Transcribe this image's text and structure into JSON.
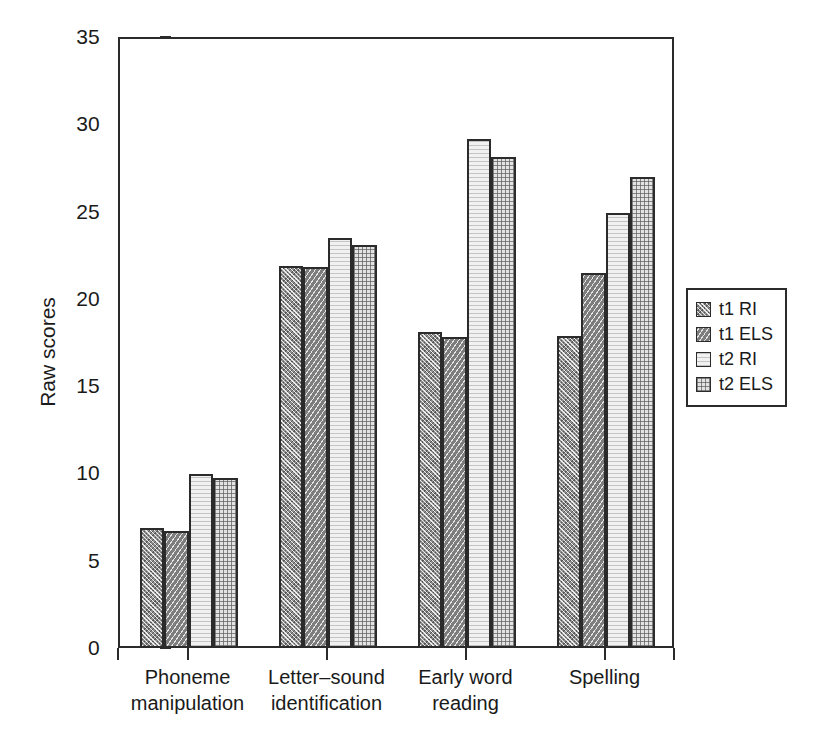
{
  "chart_data": {
    "type": "bar",
    "title": "",
    "xlabel": "",
    "ylabel": "Raw scores",
    "ylim": [
      0,
      35
    ],
    "yticks": [
      0,
      5,
      10,
      15,
      20,
      25,
      30,
      35
    ],
    "ytick_labels": [
      "0",
      "5",
      "10",
      "15",
      "20",
      "25",
      "30",
      "35"
    ],
    "grid": false,
    "legend_position": "right-outside",
    "categories": [
      "Phoneme manipulation",
      "Letter–sound identification",
      "Early word reading",
      "Spelling"
    ],
    "category_lines": [
      [
        "Phoneme",
        "manipulation"
      ],
      [
        "Letter–sound",
        "identification"
      ],
      [
        "Early word",
        "reading"
      ],
      [
        "Spelling"
      ]
    ],
    "series": [
      {
        "name": "t1 RI",
        "key": "t1ri",
        "pattern": "dark-crosshatch",
        "color": "#8e8e8e",
        "values": [
          6.9,
          21.9,
          18.1,
          17.9
        ]
      },
      {
        "name": "t1 ELS",
        "key": "t1els",
        "pattern": "dark-diagonal-hatch",
        "color": "#7d7d7d",
        "values": [
          6.7,
          21.8,
          17.8,
          21.5
        ]
      },
      {
        "name": "t2 RI",
        "key": "t2ri",
        "pattern": "light-fine-horizontal",
        "color": "#f1f1f1",
        "values": [
          9.95,
          23.5,
          29.15,
          24.9
        ]
      },
      {
        "name": "t2 ELS",
        "key": "t2els",
        "pattern": "light-grid",
        "color": "#e3e3e3",
        "values": [
          9.75,
          23.1,
          28.15,
          27.0
        ]
      }
    ]
  },
  "axis": {
    "y_title": "Raw scores"
  },
  "legend": {
    "items": [
      {
        "label": "t1 RI",
        "key": "t1ri"
      },
      {
        "label": "t1 ELS",
        "key": "t1els"
      },
      {
        "label": "t2 RI",
        "key": "t2ri"
      },
      {
        "label": "t2 ELS",
        "key": "t2els"
      }
    ]
  }
}
